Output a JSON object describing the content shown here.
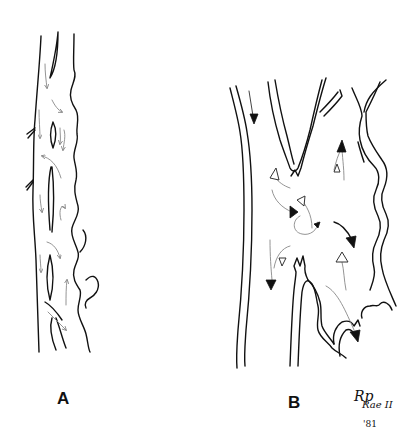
{
  "figure": {
    "panels": [
      {
        "id": "A",
        "label": "A",
        "description": "Narrow vessel with irregular walls, septa and slow multidirectional flow arrows"
      },
      {
        "id": "B",
        "label": "B",
        "description": "Branching vessel with turbulent flow; solid and open arrowheads indicating flow directions"
      }
    ],
    "signature": {
      "name": "R. Rae II",
      "line1": "Rp",
      "line2": "Rae II",
      "year": "'81"
    },
    "colors": {
      "ink": "#111111",
      "background": "#ffffff",
      "faint_arrow": "#888888"
    }
  }
}
